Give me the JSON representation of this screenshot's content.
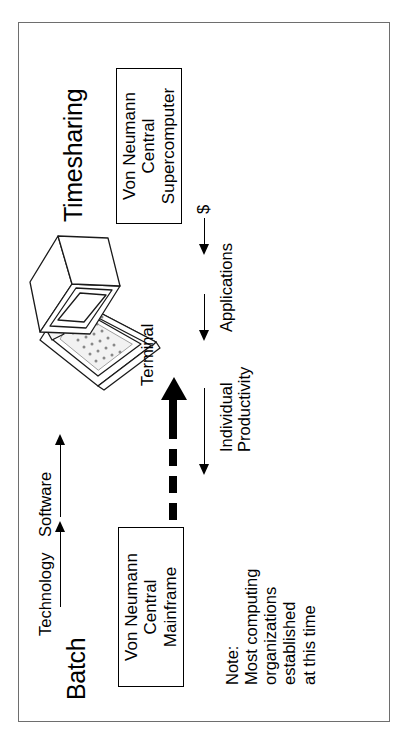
{
  "diagram": {
    "title_batch": "Batch",
    "title_timesharing": "Timesharing",
    "boxes": {
      "mainframe": {
        "line1": "Von Neumann",
        "line2": "Central",
        "line3": "Mainframe"
      },
      "supercomputer": {
        "line1": "Von Neumann",
        "line2": "Central",
        "line3": "Supercomputer"
      }
    },
    "labels": {
      "technology": "Technology",
      "software": "Software",
      "individual_productivity_line1": "Individual",
      "individual_productivity_line2": "Productivity",
      "applications": "Applications",
      "money": "$",
      "terminal": "Terminal"
    },
    "note": {
      "line1": "Note:",
      "line2": "Most computing",
      "line3": "organizations",
      "line4": "established",
      "line5": "at this time"
    },
    "colors": {
      "ink": "#000000",
      "frame": "#6e6e6e",
      "paper": "#ffffff"
    }
  }
}
